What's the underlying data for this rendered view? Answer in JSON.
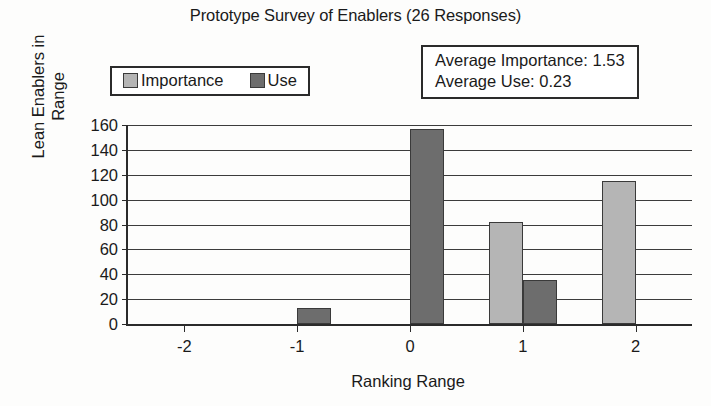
{
  "chart_data": {
    "type": "bar",
    "title": "Prototype Survey of Enablers (26 Responses)",
    "xlabel": "Ranking Range",
    "ylabel": "Lean Enablers in Range",
    "categories": [
      "-2",
      "-1",
      "0",
      "1",
      "2"
    ],
    "series": [
      {
        "name": "Importance",
        "color": "#b5b5b5",
        "values": [
          0,
          0,
          0,
          82,
          115
        ]
      },
      {
        "name": "Use",
        "color": "#6d6d6d",
        "values": [
          0,
          13,
          157,
          35,
          0
        ]
      }
    ],
    "ylim": [
      0,
      160
    ],
    "yticks": [
      0,
      20,
      40,
      60,
      80,
      100,
      120,
      140,
      160
    ],
    "ytick_labels": [
      "0",
      "20",
      "40",
      "60",
      "80",
      "100",
      "120",
      "140",
      "160"
    ],
    "grid": "horizontal",
    "legend_position": "above-left",
    "annotations": [
      "Average Importance: 1.53",
      "Average Use: 0.23"
    ],
    "ylabel_lines": [
      "Lean Enablers in",
      "Range"
    ]
  },
  "legend": {
    "entries": [
      {
        "label": "Importance",
        "color": "#b5b5b5"
      },
      {
        "label": "Use",
        "color": "#6d6d6d"
      }
    ]
  },
  "annotation": {
    "line1": "Average Importance: 1.53",
    "line2": "Average Use: 0.23"
  },
  "axis": {
    "x_title": "Ranking Range",
    "y_title_line1": "Lean Enablers in",
    "y_title_line2": "Range"
  }
}
